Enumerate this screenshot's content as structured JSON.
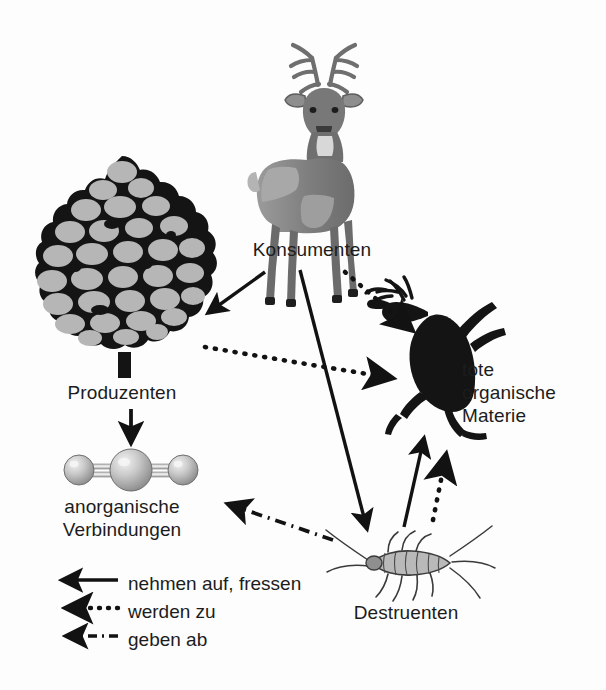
{
  "diagram": {
    "background_color": "#fdfdfd",
    "ink_color": "#1c1c1c",
    "nodes": [
      {
        "id": "konsumenten",
        "label": "Konsumenten",
        "icon": "deer-illustration",
        "x": 312,
        "y": 150
      },
      {
        "id": "produzenten",
        "label": "Produzenten",
        "icon": "tree-illustration",
        "x": 122,
        "y": 270
      },
      {
        "id": "anorganische_verbindungen",
        "label": "anorganische\nVerbindungen",
        "icon": "molecule-illustration",
        "x": 128,
        "y": 468
      },
      {
        "id": "tote_organische_materie",
        "label": "tote\norganische\nMaterie",
        "icon": "dead-deer-silhouette",
        "x": 440,
        "y": 355
      },
      {
        "id": "destruenten",
        "label": "Destruenten",
        "icon": "silverfish-illustration",
        "x": 406,
        "y": 560
      }
    ],
    "edges": [
      {
        "id": "konsumenten-to-produzenten",
        "from": "konsumenten",
        "to": "produzenten",
        "style": "solid",
        "relation": "nehmen auf, fressen"
      },
      {
        "id": "konsumenten-to-tote",
        "from": "konsumenten",
        "to": "tote_organische_materie",
        "style": "dotted",
        "relation": "werden zu"
      },
      {
        "id": "konsumenten-to-destruenten",
        "from": "konsumenten",
        "to": "destruenten",
        "style": "solid",
        "relation": "nehmen auf, fressen"
      },
      {
        "id": "produzenten-to-anorganische",
        "from": "produzenten",
        "to": "anorganische_verbindungen",
        "style": "solid",
        "relation": "nehmen auf, fressen"
      },
      {
        "id": "produzenten-to-tote",
        "from": "produzenten",
        "to": "tote_organische_materie",
        "style": "dotted",
        "relation": "werden zu"
      },
      {
        "id": "destruenten-to-tote",
        "from": "destruenten",
        "to": "tote_organische_materie",
        "style": "solid",
        "relation": "nehmen auf, fressen"
      },
      {
        "id": "destruenten-to-tote-dotted",
        "from": "destruenten",
        "to": "tote_organische_materie",
        "style": "dotted",
        "relation": "werden zu"
      },
      {
        "id": "destruenten-to-anorganische",
        "from": "destruenten",
        "to": "anorganische_verbindungen",
        "style": "dashdot",
        "relation": "geben ab"
      }
    ]
  },
  "legend": {
    "items": [
      {
        "id": "solid",
        "style": "solid",
        "label": "nehmen auf, fressen"
      },
      {
        "id": "dotted",
        "style": "dotted",
        "label": "werden zu"
      },
      {
        "id": "dashdot",
        "style": "dashdot",
        "label": "geben ab"
      }
    ]
  }
}
